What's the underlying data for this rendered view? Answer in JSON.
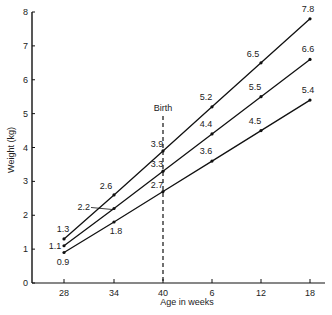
{
  "chart_data": {
    "type": "line",
    "title": "",
    "xlabel": "Age in weeks",
    "ylabel": "Weight (kg)",
    "ylim": [
      0,
      8
    ],
    "yticks": [
      0,
      1,
      2,
      3,
      4,
      5,
      6,
      7,
      8
    ],
    "categories": [
      "28",
      "34",
      "40",
      "6",
      "12",
      "18"
    ],
    "annotation": {
      "label": "Birth",
      "at": "40",
      "style": "dashed vertical line"
    },
    "grid": false,
    "legend": null,
    "series": [
      {
        "name": "upper",
        "values": [
          1.3,
          2.6,
          3.9,
          5.2,
          6.5,
          7.8
        ]
      },
      {
        "name": "middle",
        "values": [
          1.1,
          2.2,
          3.3,
          4.4,
          5.5,
          6.6
        ]
      },
      {
        "name": "lower",
        "values": [
          0.9,
          1.8,
          2.7,
          3.6,
          4.5,
          5.4
        ]
      }
    ]
  },
  "labels": {
    "xlabel": "Age in weeks",
    "ylabel": "Weight (kg)",
    "birth": "Birth"
  }
}
